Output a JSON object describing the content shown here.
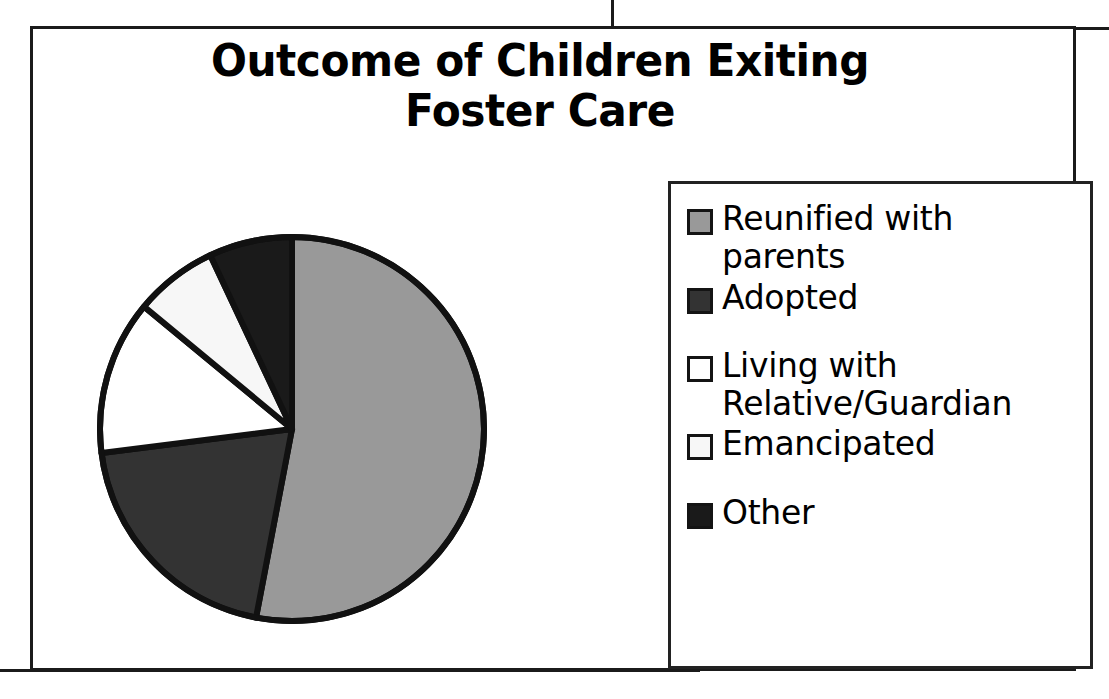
{
  "chart_data": {
    "type": "pie",
    "title": "Outcome of Children Exiting\nFoster Care",
    "categories": [
      "Reunified with parents",
      "Adopted",
      "Living with Relative/Guardian",
      "Emancipated",
      "Other"
    ],
    "values": [
      53,
      20,
      13,
      7,
      7
    ],
    "unit": "percent",
    "start_angle_deg": 0,
    "direction": "clockwise",
    "legend_position": "right",
    "grid": false,
    "slice_colors": [
      "#999999",
      "#333333",
      "#ffffff",
      "#f7f7f7",
      "#1a1a1a"
    ],
    "slice_border_color": "#111111",
    "xlabel": "",
    "ylabel": "",
    "slices": [
      {
        "label": "Reunified with parents",
        "value": 53,
        "color": "#999999"
      },
      {
        "label": "Adopted",
        "value": 20,
        "color": "#333333"
      },
      {
        "label": "Living with Relative/Guardian",
        "value": 13,
        "color": "#ffffff"
      },
      {
        "label": "Emancipated",
        "value": 7,
        "color": "#f7f7f7"
      },
      {
        "label": "Other",
        "value": 7,
        "color": "#1a1a1a"
      }
    ]
  },
  "title": {
    "text": "Outcome of Children Exiting\nFoster Care"
  },
  "legend": {
    "items": [
      {
        "label": "Reunified with\nparents",
        "color": "#999999"
      },
      {
        "label": "Adopted",
        "color": "#333333"
      },
      {
        "label": "Living with\nRelative/Guardian",
        "color": "#ffffff"
      },
      {
        "label": "Emancipated",
        "color": "#f7f7f7"
      },
      {
        "label": "Other",
        "color": "#1a1a1a"
      }
    ]
  }
}
